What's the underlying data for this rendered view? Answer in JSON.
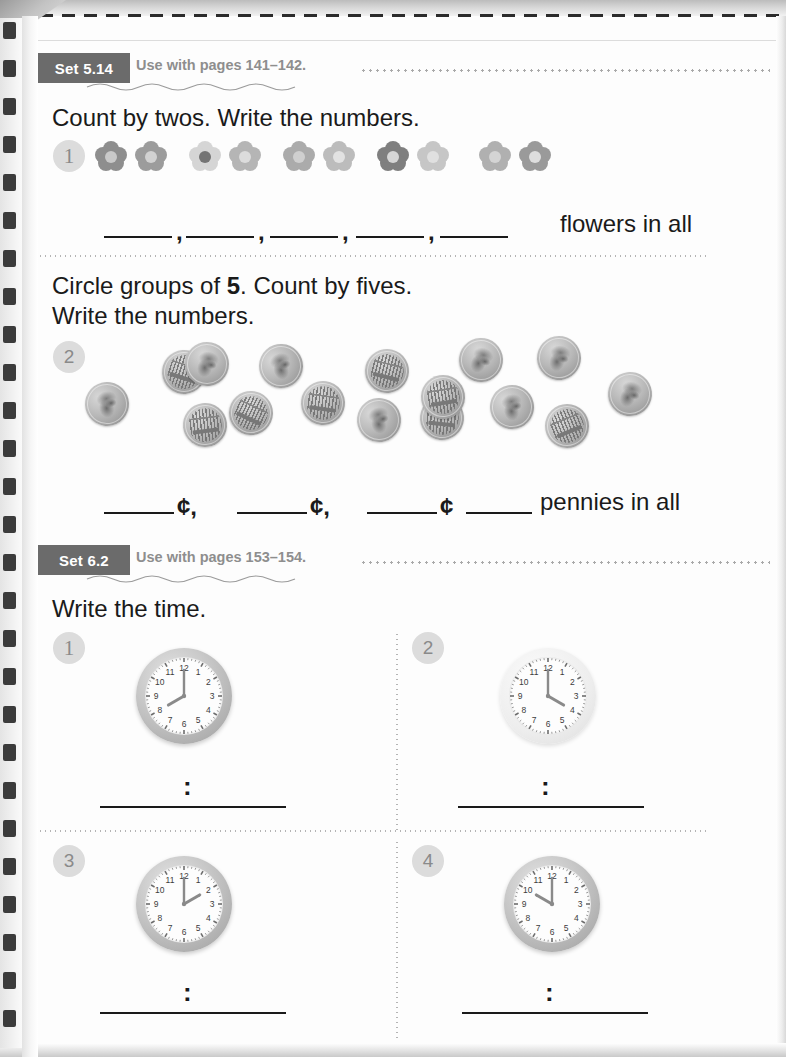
{
  "page": {
    "paper_color": "#fdfdfd",
    "binding": "spiral-wire",
    "cut_line": "dashed"
  },
  "sets": [
    {
      "tag": "Set 5.14",
      "use_with": "Use with pages 141–142.",
      "tag_color": "#6b6b6b",
      "label_color": "#8e8e8e"
    },
    {
      "tag": "Set 6.2",
      "use_with": "Use with pages 153–154.",
      "tag_color": "#6b6b6b",
      "label_color": "#8e8e8e"
    }
  ],
  "exercise_1": {
    "number": "1",
    "prompt": "Count by twos. Write the numbers.",
    "object": "flower",
    "object_count": 10,
    "group_size": 2,
    "group_count": 5,
    "blank_count": 5,
    "separator": ",",
    "tail_text": "flowers in all",
    "flower_colors": [
      {
        "petal": "#8e8e8e",
        "core": "#c9c9c9"
      },
      {
        "petal": "#9c9c9c",
        "core": "#d2d2d2"
      },
      {
        "petal": "#d5d5d5",
        "core": "#747474"
      },
      {
        "petal": "#b5b5b5",
        "core": "#dcdcdc"
      },
      {
        "petal": "#ababab",
        "core": "#cfcfcf"
      },
      {
        "petal": "#bcbcbc",
        "core": "#e2e2e2"
      },
      {
        "petal": "#7f7f7f",
        "core": "#d6d6d6"
      },
      {
        "petal": "#c6c6c6",
        "core": "#e0e0e0"
      },
      {
        "petal": "#b0b0b0",
        "core": "#d4d4d4"
      },
      {
        "petal": "#9a9a9a",
        "core": "#dedede"
      }
    ]
  },
  "exercise_2": {
    "number": "2",
    "prompt_line_1_before": "Circle groups of ",
    "prompt_line_1_bold": "5",
    "prompt_line_1_after": ". Count by fives.",
    "prompt_line_2": "Write the numbers.",
    "object": "penny",
    "object_count": 15,
    "group_size": 5,
    "group_count": 3,
    "blank_count": 3,
    "cent_symbol": "¢",
    "separator": ",",
    "tail_text": "pennies in all",
    "tail_blank": true,
    "pennies": [
      {
        "x": 85,
        "y": 382,
        "rot": -14,
        "face": "head"
      },
      {
        "x": 162,
        "y": 350,
        "rot": 18,
        "face": "bld"
      },
      {
        "x": 183,
        "y": 403,
        "rot": -7,
        "face": "bld"
      },
      {
        "x": 185,
        "y": 342,
        "rot": 12,
        "face": "head"
      },
      {
        "x": 229,
        "y": 391,
        "rot": 25,
        "face": "bld"
      },
      {
        "x": 259,
        "y": 344,
        "rot": -20,
        "face": "head"
      },
      {
        "x": 301,
        "y": 381,
        "rot": 8,
        "face": "bld"
      },
      {
        "x": 357,
        "y": 398,
        "rot": -16,
        "face": "head"
      },
      {
        "x": 365,
        "y": 349,
        "rot": 14,
        "face": "bld"
      },
      {
        "x": 420,
        "y": 396,
        "rot": 6,
        "face": "bld"
      },
      {
        "x": 421,
        "y": 375,
        "rot": -9,
        "face": "bld"
      },
      {
        "x": 459,
        "y": 338,
        "rot": 20,
        "face": "head"
      },
      {
        "x": 490,
        "y": 385,
        "rot": -12,
        "face": "head"
      },
      {
        "x": 537,
        "y": 336,
        "rot": 10,
        "face": "head"
      },
      {
        "x": 545,
        "y": 404,
        "rot": -22,
        "face": "bld"
      },
      {
        "x": 608,
        "y": 372,
        "rot": 16,
        "face": "head"
      }
    ]
  },
  "exercise_clocks": {
    "prompt": "Write the time.",
    "colon": ":",
    "items": [
      {
        "number": "1",
        "hour": 8,
        "minute": 0,
        "style": "dark"
      },
      {
        "number": "2",
        "hour": 4,
        "minute": 0,
        "style": "light"
      },
      {
        "number": "3",
        "hour": 2,
        "minute": 0,
        "style": "dark"
      },
      {
        "number": "4",
        "hour": 10,
        "minute": 0,
        "style": "dark"
      }
    ],
    "numerals": [
      "12",
      "1",
      "2",
      "3",
      "4",
      "5",
      "6",
      "7",
      "8",
      "9",
      "10",
      "11"
    ]
  }
}
